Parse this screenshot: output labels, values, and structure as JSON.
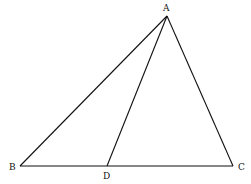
{
  "diagram": {
    "type": "triangle-with-cevian",
    "points": {
      "A": {
        "label": "A",
        "x": 167,
        "y": 16
      },
      "B": {
        "label": "B",
        "x": 20,
        "y": 166
      },
      "C": {
        "label": "C",
        "x": 233,
        "y": 166
      },
      "D": {
        "label": "D",
        "x": 107,
        "y": 166
      }
    },
    "segments": [
      {
        "from": "A",
        "to": "B"
      },
      {
        "from": "A",
        "to": "C"
      },
      {
        "from": "B",
        "to": "C"
      },
      {
        "from": "A",
        "to": "D"
      }
    ],
    "labels": {
      "A": "A",
      "B": "B",
      "C": "C",
      "D": "D"
    },
    "stroke_color": "#111111"
  }
}
